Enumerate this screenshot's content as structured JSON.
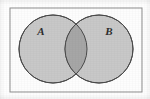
{
  "figure": {
    "name": "venn-diagram-two-sets",
    "kind": "venn-diagram",
    "width": 150,
    "height": 99,
    "background_color": "#fefefe"
  },
  "universal_set": {
    "shape": "rectangle",
    "x": 10,
    "y": 8,
    "width": 132,
    "height": 84,
    "fill_color": "#fdfdfd",
    "stroke_color": "#8d8d8d",
    "stroke_width": 1
  },
  "sets": [
    {
      "label": "A",
      "shape": "circle",
      "cx": 53,
      "cy": 49,
      "r": 34,
      "fill_color": "#c8c8c8",
      "stroke_color": "#4a4a4a",
      "stroke_width": 1,
      "label_x": 41,
      "label_y": 32
    },
    {
      "label": "B",
      "shape": "circle",
      "cx": 99,
      "cy": 49,
      "r": 34,
      "fill_color": "#c8c8c8",
      "stroke_color": "#4a4a4a",
      "stroke_width": 1,
      "label_x": 109,
      "label_y": 32
    }
  ],
  "intersection": {
    "name": "A-intersect-B",
    "fill_color": "#a6a6a6",
    "description": "lens-shaped overlap region"
  },
  "colors": {
    "circle_fill": "#c8c8c8",
    "intersection_fill": "#a6a6a6",
    "circle_stroke": "#4a4a4a",
    "rect_stroke": "#8d8d8d",
    "label_color": "#2e2e2e",
    "page_background": "#ffffff"
  }
}
